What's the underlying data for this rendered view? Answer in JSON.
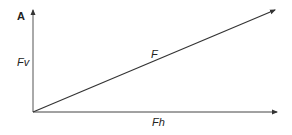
{
  "diagram": {
    "type": "force-vector-decomposition",
    "corner_label": "A",
    "vertical_component_label": "Fv",
    "resultant_label": "F",
    "horizontal_component_label": "Fh",
    "line_color": "#333333"
  }
}
